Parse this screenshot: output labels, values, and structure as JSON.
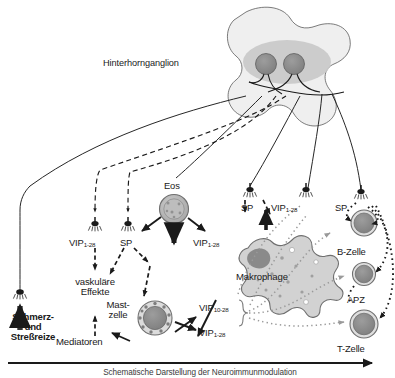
{
  "figure": {
    "title": "Hinterhornganglion",
    "caption": "Schematische Darstellung der Neuroimmunmodulation",
    "language": "de"
  },
  "colors": {
    "ganglion_body": "#efefef",
    "ganglion_core": "#c9c9c9",
    "neuron_soma": "#8e8e8e",
    "cell_fill": "#b5b5b5",
    "cell_rim": "#d9d9d9",
    "macrophage_fill": "#d2d2d2",
    "nucleus": "#8a8a8a",
    "line": "#1a1a1a",
    "dotted_gray": "#9a9a9a",
    "text": "#1a1a1a"
  },
  "structures": {
    "ganglion_label": "Hinterhornganglion",
    "neuron_count": 2
  },
  "cells": [
    {
      "name": "eosinophil",
      "label": "Eos",
      "x": 174,
      "y": 185
    },
    {
      "name": "mast-cell",
      "label": "Mast-\nzelle",
      "x": 152,
      "y": 315
    },
    {
      "name": "macrophage",
      "label": "Makrophage",
      "x": 272,
      "y": 272
    },
    {
      "name": "b-cell",
      "label": "B-Zelle",
      "x": 364,
      "y": 240
    },
    {
      "name": "apc",
      "label": "APZ",
      "x": 364,
      "y": 290
    },
    {
      "name": "t-cell",
      "label": "T-Zelle",
      "x": 364,
      "y": 338
    }
  ],
  "mediators": {
    "sp": "SP",
    "vip_1_28_a": "VIP",
    "vip_1_28_sub": "1-28",
    "vip_10_28_sub": "10-28",
    "labels": [
      {
        "name": "vip-left",
        "text": "VIP",
        "sub": "1-28"
      },
      {
        "name": "sp-left",
        "text": "SP",
        "sub": ""
      },
      {
        "name": "vip-eos",
        "text": "VIP",
        "sub": "1-28"
      },
      {
        "name": "sp-mid",
        "text": "SP",
        "sub": ""
      },
      {
        "name": "vip-mid",
        "text": "VIP",
        "sub": "1-28"
      },
      {
        "name": "sp-right",
        "text": "SP",
        "sub": ""
      },
      {
        "name": "vip-mast-10-28",
        "text": "VIP",
        "sub": "10-28"
      },
      {
        "name": "vip-mast-1-28",
        "text": "VIP",
        "sub": "1-28"
      }
    ]
  },
  "effects": {
    "vascular_line1": "vaskuläre",
    "vascular_line2": "Effekte",
    "mediators": "Mediatoren"
  },
  "stimulus": {
    "line1": "Schmerz-",
    "line2": "und",
    "line3": "Streßreize"
  },
  "axis": {
    "caption": "Schematische Darstellung der Neuroimmunmodulation",
    "direction": "right"
  }
}
